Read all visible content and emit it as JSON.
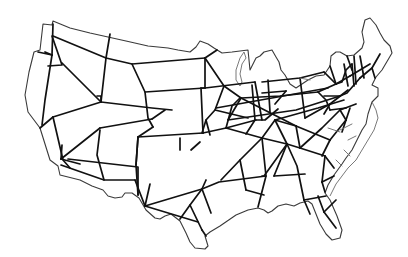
{
  "map": {
    "subject": "Contiguous United States outline with highway network",
    "colors": {
      "background": "#ffffff",
      "outline": "#3a3a3a",
      "roads": "#111111",
      "secondary_roads": "#777777"
    },
    "outline_path": "M52,25 L43,24 L40,50 L34,52 L29,72 L25,95 L28,112 L40,128 L50,160 L58,166 L60,175 L64,176 L80,180 L92,186 L103,190 L108,196 L115,198 L122,197 L125,193 L132,193 L139,198 L146,210 L155,218 L160,219 L165,216 L171,214 L180,221 L186,233 L190,242 L195,248 L205,249 L208,246 L205,236 L210,232 L220,226 L236,215 L248,210 L258,208 L264,210 L268,213 L272,211 L278,206 L286,204 L294,206 L300,203 L308,201 L312,204 L316,214 L320,224 L326,234 L332,240 L340,238 L342,230 L337,216 L330,200 L325,193 L328,185 L334,175 L342,164 L346,158 L352,150 L357,140 L362,130 L366,124 L368,114 L372,102 L378,96 L378,88 L372,85 L376,77 L382,70 L392,53 L390,46 L384,40 L380,33 L376,25 L370,18 L365,20 L362,32 L364,42 L362,48 L354,55 L347,56 L340,52 L336,52 L331,56 L330,66 L324,75 L316,76 L308,80 L296,88 L290,84 L285,75 L281,70 L279,62 L276,57 L272,50 L264,52 L260,56 L256,58 L254,62 L250,70 L248,50 L232,52 L222,53 L214,48 L208,44 L200,41 L196,47 L190,52 L178,50 L168,48 L148,46 L126,41 L108,37 L90,33 L70,28 L53,21 L52,25 Z",
    "inner_outlines": [
      "M244,52 L240,58 L236,70 L236,80 L240,86 L242,82 L240,74 L242,64 L246,58 Z",
      "M372,102 L376,110 L378,118 L374,130 L368,140 L362,150 L356,160 L348,168 L342,176 L336,184 L330,196"
    ],
    "roads": [
      "M53,24 L52,55",
      "M52,55 L45,52",
      "M52,55 L38,52",
      "M52,55 L45,100 L42,125",
      "M52,36 L62,65 L48,66",
      "M53,36 L106,58",
      "M62,63 L101,102",
      "M106,58 L110,34",
      "M106,58 L101,102",
      "M106,58 L132,64 L205,58",
      "M132,64 L145,92 L148,118 L153,127",
      "M145,92 L205,88",
      "M101,102 L53,117",
      "M101,102 L152,108 L172,110",
      "M165,110 L152,119",
      "M152,119 L100,128",
      "M53,117 L40,128",
      "M53,117 L63,160 L70,168",
      "M101,102 L101,96 L97,96",
      "M100,128 L61,159",
      "M61,159 L80,164",
      "M61,165 L104,180",
      "M61,159 L62,145",
      "M68,159 L138,167 L138,195",
      "M100,130 L97,155 L104,180 L135,180",
      "M138,137 L136,165",
      "M153,127 L138,137",
      "M138,137 L203,133",
      "M138,137 L136,165 L138,195",
      "M203,133 L201,88",
      "M203,133 L226,128",
      "M180,150 L180,138",
      "M191,150 L200,142",
      "M135,180 L145,206",
      "M145,206 L150,184",
      "M145,206 L202,189",
      "M145,206 L198,222",
      "M202,189 L206,180",
      "M202,189 L211,213",
      "M202,189 L219,182 L266,176",
      "M202,189 L190,205 L180,219",
      "M190,205 L202,230",
      "M205,58 L205,88 L201,88",
      "M205,58 L217,50",
      "M205,58 L224,86 L241,98",
      "M205,88 L255,82",
      "M224,86 L215,110 L206,120 L210,135",
      "M241,98 L228,120",
      "M226,128 L232,106 L240,98",
      "M226,128 L256,120",
      "M226,128 L262,138",
      "M262,138 L275,120",
      "M262,138 L240,160 L221,180",
      "M262,138 L287,144",
      "M262,138 L266,176 L258,207",
      "M240,160 L246,190",
      "M246,190 L264,195",
      "M206,120 L202,133",
      "M215,110 L248,118",
      "M241,98 L280,96 L318,92",
      "M241,98 L296,126",
      "M228,120 L296,110 L340,96",
      "M216,108 L328,88",
      "M252,85 L255,120",
      "M255,82 L262,120",
      "M268,80 L270,112",
      "M262,82 L300,78 L324,72",
      "M262,93 L286,91",
      "M300,78 L305,118",
      "M286,91 L275,104",
      "M256,120 L265,120 L278,109",
      "M255,120 L246,134",
      "M275,120 L287,144 L300,148",
      "M275,120 L318,108 L344,100",
      "M275,120 L296,126",
      "M296,126 L300,148",
      "M287,144 L297,166 L304,200",
      "M287,144 L264,176 L262,176",
      "M287,144 L274,176",
      "M274,176 L305,174",
      "M304,200 L310,214",
      "M304,200 L326,196",
      "M300,148 L325,156",
      "M300,148 L322,128 L340,110",
      "M296,126 L330,140",
      "M305,118 L330,104 L348,90",
      "M318,92 L326,100 L330,110",
      "M318,92 L336,84",
      "M324,72 L336,84",
      "M330,104 L324,114",
      "M330,110 L346,108",
      "M324,96 L340,96",
      "M336,84 L350,76",
      "M340,96 L347,93 L360,78",
      "M336,84 L342,82 L346,70 L352,64",
      "M344,64 L348,86",
      "M352,64 L354,86",
      "M354,56 L356,84",
      "M347,56 L352,70",
      "M360,56 L364,78",
      "M350,76 L370,64",
      "M360,78 L372,68 L380,54",
      "M372,68 L375,78",
      "M330,66 L336,84",
      "M325,156 L322,182",
      "M322,182 L325,192",
      "M322,182 L334,176",
      "M325,156 L334,168",
      "M318,196 L324,212",
      "M324,212 L336,200",
      "M324,212 L336,228",
      "M330,140 L322,156",
      "M330,140 L346,120",
      "M346,120 L350,108",
      "M346,120 L342,132",
      "M340,110 L356,104",
      "M340,110 L346,120",
      "M202,230 L206,236"
    ],
    "secondary_roads": [
      "M340,130 L352,124",
      "M348,140 L356,136",
      "M344,150 L350,156",
      "M336,160 L342,166",
      "M328,128 L340,132",
      "M300,78 L310,80"
    ]
  }
}
